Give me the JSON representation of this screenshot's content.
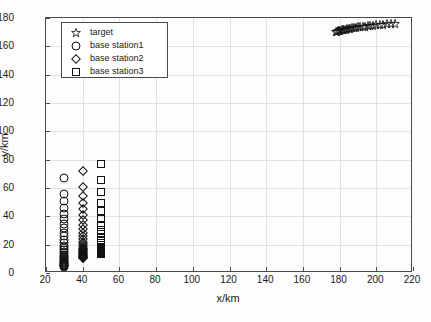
{
  "chart_data": {
    "type": "scatter",
    "title": "",
    "xlabel": "x/km",
    "ylabel": "y/km",
    "xlim": [
      20,
      220
    ],
    "ylim": [
      0,
      180
    ],
    "xticks": [
      20,
      40,
      60,
      80,
      100,
      120,
      140,
      160,
      180,
      200,
      220
    ],
    "yticks": [
      0,
      20,
      40,
      60,
      80,
      100,
      120,
      140,
      160,
      180
    ],
    "grid": true,
    "legend_position": "upper left",
    "series": [
      {
        "name": "target",
        "marker": "star",
        "points": [
          [
            178.0,
            170.2
          ],
          [
            178.6,
            170.4
          ],
          [
            179.2,
            170.6
          ],
          [
            179.8,
            170.8
          ],
          [
            180.4,
            171.0
          ],
          [
            181.1,
            171.2
          ],
          [
            181.8,
            171.4
          ],
          [
            182.5,
            171.6
          ],
          [
            183.3,
            171.8
          ],
          [
            184.1,
            172.0
          ],
          [
            185.0,
            172.2
          ],
          [
            185.9,
            172.4
          ],
          [
            186.9,
            172.6
          ],
          [
            187.9,
            172.8
          ],
          [
            189.0,
            173.1
          ],
          [
            190.1,
            173.3
          ],
          [
            191.3,
            173.5
          ],
          [
            192.6,
            173.8
          ],
          [
            193.9,
            174.0
          ],
          [
            195.3,
            174.2
          ],
          [
            196.8,
            174.5
          ],
          [
            198.4,
            174.7
          ],
          [
            200.1,
            175.0
          ],
          [
            201.9,
            175.2
          ],
          [
            203.8,
            175.4
          ],
          [
            205.8,
            175.6
          ],
          [
            207.9,
            175.8
          ],
          [
            210.1,
            176.1
          ]
        ]
      },
      {
        "name": "base station1",
        "marker": "circle",
        "x": 30,
        "y_values": [
          66.8,
          56.0,
          50.5,
          46.0,
          42.0,
          38.2,
          34.8,
          31.5,
          28.5,
          25.8,
          23.2,
          21.0,
          19.2,
          17.6,
          16.2,
          15.0,
          14.0,
          13.0,
          12.1,
          11.3,
          10.6,
          9.9,
          9.2,
          8.6,
          8.0,
          7.4,
          6.9,
          6.4,
          5.9,
          5.4,
          5.0,
          4.6,
          4.2
        ]
      },
      {
        "name": "base station2",
        "marker": "diamond",
        "x": 40,
        "y_values": [
          72.0,
          61.0,
          54.5,
          49.5,
          45.0,
          41.0,
          37.4,
          34.0,
          31.0,
          28.3,
          26.0,
          24.0,
          22.2,
          20.6,
          19.2,
          18.0,
          17.0,
          16.1,
          15.3,
          14.6,
          13.9,
          13.3,
          12.7,
          12.2,
          11.7,
          11.3,
          10.9,
          10.5
        ]
      },
      {
        "name": "base station3",
        "marker": "square",
        "x": 50,
        "y_values": [
          76.8,
          65.5,
          57.0,
          49.5,
          43.5,
          38.2,
          34.0,
          30.5,
          27.5,
          25.0,
          23.0,
          21.3,
          19.9,
          18.7,
          17.7,
          16.9,
          16.2,
          15.6,
          15.1,
          14.6,
          14.2,
          13.9,
          13.6,
          13.3
        ]
      }
    ]
  },
  "legend": {
    "items": [
      {
        "label": "target",
        "marker": "star"
      },
      {
        "label": "base station1",
        "marker": "circle"
      },
      {
        "label": "base station2",
        "marker": "diamond"
      },
      {
        "label": "base station3",
        "marker": "square"
      }
    ]
  },
  "axes": {
    "xlabel": "x/km",
    "ylabel": "y/km"
  }
}
